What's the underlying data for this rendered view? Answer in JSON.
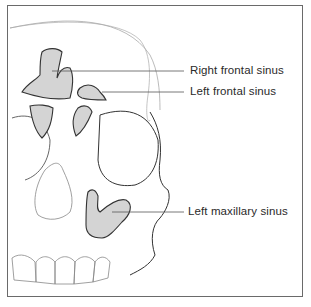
{
  "figure": {
    "labels": [
      {
        "id": "right-frontal-sinus",
        "text": "Right frontal sinus"
      },
      {
        "id": "left-frontal-sinus",
        "text": "Left frontal sinus"
      },
      {
        "id": "left-maxillary-sinus",
        "text": "Left maxillary sinus"
      }
    ],
    "colors": {
      "sinus_fill": "#d4d4d4",
      "sinus_stroke": "#333333",
      "bone_line": "#8a8a8a",
      "frame": "#6a6a6a",
      "leader_line": "#555555"
    }
  }
}
